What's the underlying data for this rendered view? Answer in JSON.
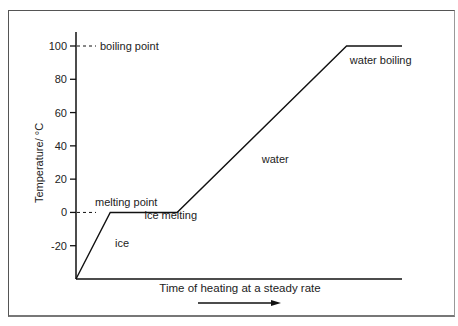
{
  "chart_data": {
    "type": "line",
    "title": "",
    "xlabel": "Time of heating at a steady rate",
    "ylabel": "Temperature/ °C",
    "ylim": [
      -40,
      100
    ],
    "yticks": [
      100,
      80,
      60,
      40,
      20,
      0,
      -20
    ],
    "ytick_labels": [
      "100",
      "80",
      "60",
      "40",
      "20",
      "0",
      "-20"
    ],
    "x_units": "relative time (no scale)",
    "xlim": [
      0,
      100
    ],
    "series": [
      {
        "name": "heating curve",
        "x": [
          0,
          10.5,
          31,
          83,
          100
        ],
        "y": [
          -40,
          0,
          0,
          100,
          100
        ]
      }
    ],
    "reference_lines": [
      {
        "value": 100,
        "label": "boiling point",
        "style": "dashed"
      },
      {
        "value": 0,
        "label": "melting point",
        "style": "dashed"
      }
    ],
    "annotations": [
      {
        "text": "ice",
        "x": 12,
        "y": -21
      },
      {
        "text": "ice melting",
        "x": 21,
        "y": -4
      },
      {
        "text": "water",
        "x": 57,
        "y": 30
      },
      {
        "text": "water boiling",
        "x": 84,
        "y": 89
      }
    ],
    "x_arrow": true,
    "grid": false,
    "legend": "none"
  }
}
